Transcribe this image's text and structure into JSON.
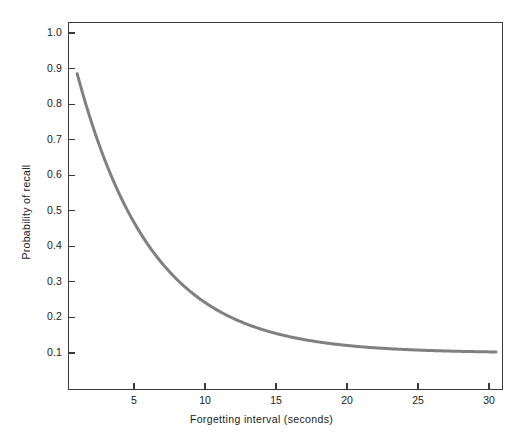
{
  "chart_data": {
    "type": "line",
    "title": "",
    "subtitle": "",
    "xlabel": "Forgetting interval (seconds)",
    "ylabel": "Probability of recall",
    "xlim": [
      0.4,
      30.8
    ],
    "ylim": [
      0.0,
      1.06
    ],
    "grid": false,
    "legend": null,
    "legend_position": "none",
    "annotations": [],
    "xticks": [
      5,
      10,
      15,
      20,
      25,
      30
    ],
    "xtick_labels": [
      "5",
      "10",
      "15",
      "20",
      "25",
      "30"
    ],
    "yticks": [
      0.1,
      0.2,
      0.3,
      0.4,
      0.5,
      0.6,
      0.7,
      0.8,
      0.9,
      1.0
    ],
    "ytick_labels": [
      "0.1",
      "0.2",
      "0.3",
      "0.4",
      "0.5",
      "0.6",
      "0.7",
      "0.8",
      "0.9",
      "1.0"
    ],
    "series": [
      {
        "name": "Probability of recall",
        "color": "#808080",
        "line_width": 3,
        "x": [
          1,
          2,
          3,
          4,
          5,
          6,
          7,
          8,
          9,
          10,
          11,
          12,
          13,
          14,
          15,
          16,
          17,
          18,
          19,
          20,
          21,
          22,
          23,
          24,
          25,
          26,
          27,
          28,
          29,
          30,
          30.5
        ],
        "values": [
          0.98,
          0.87,
          0.78,
          0.69,
          0.62,
          0.55,
          0.49,
          0.44,
          0.4,
          0.35,
          0.32,
          0.29,
          0.27,
          0.24,
          0.21,
          0.19,
          0.18,
          0.16,
          0.15,
          0.14,
          0.13,
          0.125,
          0.12,
          0.115,
          0.11,
          0.108,
          0.106,
          0.105,
          0.104,
          0.103,
          0.103
        ]
      }
    ],
    "curve_model": {
      "form": "asymptote + amplitude * exp(-rate * t)",
      "asymptote": 0.1,
      "amplitude": 0.95,
      "rate": 0.19
    }
  },
  "figure": {
    "background_color": "#ffffff",
    "frame_color": "#3a3a3a",
    "text_color": "#1a1a1a"
  }
}
